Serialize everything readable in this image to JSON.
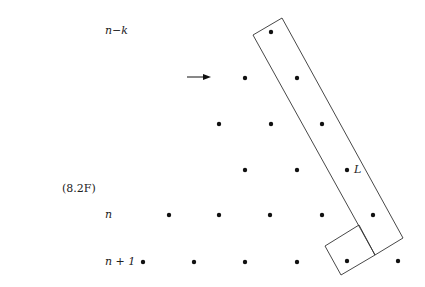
{
  "figure_label": "(8.2F)",
  "row_labels": {
    "top": "n−k",
    "n": "n",
    "n_plus_1": "n + 1"
  },
  "point_label": "L",
  "colors": {
    "ink": "#111111",
    "background": "#ffffff"
  },
  "dots": [
    [
      271,
      32
    ],
    [
      245,
      78
    ],
    [
      297,
      78
    ],
    [
      219,
      124
    ],
    [
      271,
      124
    ],
    [
      322,
      124
    ],
    [
      245,
      170
    ],
    [
      297,
      170
    ],
    [
      347,
      170
    ],
    [
      169,
      215
    ],
    [
      219,
      215
    ],
    [
      270,
      215
    ],
    [
      322,
      215
    ],
    [
      373,
      215
    ],
    [
      143,
      262
    ],
    [
      194,
      262
    ],
    [
      245,
      262
    ],
    [
      297,
      262
    ],
    [
      347,
      261
    ],
    [
      398,
      261
    ]
  ],
  "shapes": {
    "long_rectangle": "253,35 282,18 403,238 375,255",
    "small_square": "359,225 325,246 341,275 375,255",
    "arrow": {
      "x1": 187,
      "y1": 77,
      "x2": 210,
      "y2": 77
    }
  }
}
